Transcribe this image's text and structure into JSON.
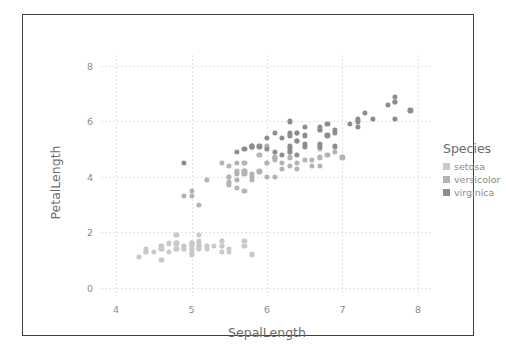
{
  "chart_data": {
    "type": "scatter",
    "title": "",
    "xlabel": "SepalLength",
    "ylabel": "PetalLength",
    "xlim": [
      3.8,
      8.2
    ],
    "ylim": [
      -0.3,
      8.4
    ],
    "xticks": [
      "4",
      "5",
      "6",
      "7",
      "8"
    ],
    "xtick_values": [
      4,
      5,
      6,
      7,
      8
    ],
    "yticks": [
      "0",
      "2",
      "4",
      "6",
      "8"
    ],
    "ytick_values": [
      0,
      2,
      4,
      6,
      8
    ],
    "grid": true,
    "legend": {
      "title": "Species",
      "position": "right",
      "entries": [
        {
          "label": "setosa",
          "color": "#c9c9c9"
        },
        {
          "label": "versicolor",
          "color": "#b3b3b3"
        },
        {
          "label": "virginica",
          "color": "#8d8d8d"
        }
      ]
    },
    "colors": {
      "setosa": "#c9c9c9",
      "versicolor": "#b3b3b3",
      "virginica": "#8d8d8d",
      "grid": "#e2e2e4",
      "frame": "#3f3f3f",
      "tick_text": "#8a8a8a",
      "axis_title": "#6b6b6b",
      "background": "#ffffff"
    },
    "series": [
      {
        "name": "setosa",
        "color": "#c9c9c9",
        "x": [
          5.1,
          4.9,
          4.7,
          4.6,
          5.0,
          5.4,
          4.6,
          5.0,
          4.4,
          4.9,
          5.4,
          4.8,
          4.8,
          4.3,
          5.8,
          5.7,
          5.4,
          5.1,
          5.7,
          5.1,
          5.4,
          5.1,
          4.6,
          5.1,
          4.8,
          5.0,
          5.0,
          5.2,
          5.2,
          4.7,
          4.8,
          5.4,
          5.2,
          5.5,
          4.9,
          5.0,
          5.5,
          4.9,
          4.4,
          5.1,
          5.0,
          4.5,
          4.4,
          5.0,
          5.1,
          4.8,
          5.1,
          4.6,
          5.3,
          5.0
        ],
        "y": [
          1.4,
          1.4,
          1.3,
          1.5,
          1.4,
          1.7,
          1.4,
          1.5,
          1.4,
          1.5,
          1.5,
          1.6,
          1.4,
          1.1,
          1.2,
          1.5,
          1.3,
          1.4,
          1.7,
          1.5,
          1.7,
          1.5,
          1.0,
          1.7,
          1.9,
          1.6,
          1.6,
          1.5,
          1.4,
          1.6,
          1.6,
          1.5,
          1.5,
          1.4,
          1.5,
          1.2,
          1.3,
          1.4,
          1.3,
          1.5,
          1.3,
          1.3,
          1.3,
          1.6,
          1.9,
          1.4,
          1.6,
          1.4,
          1.5,
          1.4
        ]
      },
      {
        "name": "versicolor",
        "color": "#b3b3b3",
        "x": [
          7.0,
          6.4,
          6.9,
          5.5,
          6.5,
          5.7,
          6.3,
          4.9,
          6.6,
          5.2,
          5.0,
          5.9,
          6.0,
          6.1,
          5.6,
          6.7,
          5.6,
          5.8,
          6.2,
          5.6,
          5.9,
          6.1,
          6.3,
          6.1,
          6.4,
          6.6,
          6.8,
          6.7,
          6.0,
          5.7,
          5.5,
          5.5,
          5.8,
          6.0,
          5.4,
          6.0,
          6.7,
          6.3,
          5.6,
          5.5,
          5.5,
          6.1,
          5.8,
          5.0,
          5.6,
          5.7,
          5.7,
          6.2,
          5.1,
          5.7
        ],
        "y": [
          4.7,
          4.5,
          4.9,
          4.0,
          4.6,
          4.5,
          4.7,
          3.3,
          4.6,
          3.9,
          3.5,
          4.2,
          4.0,
          4.7,
          3.6,
          4.4,
          4.5,
          4.1,
          4.5,
          3.9,
          4.8,
          4.0,
          4.9,
          4.7,
          4.3,
          4.4,
          4.8,
          5.0,
          4.5,
          3.5,
          3.8,
          3.7,
          3.9,
          5.1,
          4.5,
          4.5,
          4.7,
          4.4,
          4.1,
          4.0,
          4.4,
          4.6,
          4.0,
          3.3,
          4.2,
          4.2,
          4.2,
          4.3,
          3.0,
          4.1
        ]
      },
      {
        "name": "virginica",
        "color": "#8d8d8d",
        "x": [
          6.3,
          5.8,
          7.1,
          6.3,
          6.5,
          7.6,
          4.9,
          7.3,
          6.7,
          7.2,
          6.5,
          6.4,
          6.8,
          5.7,
          5.8,
          6.4,
          6.5,
          7.7,
          7.7,
          6.0,
          6.9,
          5.6,
          7.7,
          6.3,
          6.7,
          7.2,
          6.2,
          6.1,
          6.4,
          7.2,
          7.4,
          7.9,
          6.4,
          6.3,
          6.1,
          7.7,
          6.3,
          6.4,
          6.0,
          6.9,
          6.7,
          6.9,
          5.8,
          6.8,
          6.7,
          6.7,
          6.3,
          6.5,
          6.2,
          5.9
        ],
        "y": [
          6.0,
          5.1,
          5.9,
          5.6,
          5.8,
          6.6,
          4.5,
          6.3,
          5.8,
          6.1,
          5.1,
          5.3,
          5.5,
          5.0,
          5.1,
          5.3,
          5.5,
          6.7,
          6.9,
          5.0,
          5.7,
          4.9,
          6.7,
          4.9,
          5.7,
          6.0,
          4.8,
          4.9,
          5.6,
          5.8,
          6.1,
          6.4,
          5.6,
          5.1,
          5.6,
          6.1,
          5.5,
          4.8,
          5.4,
          5.6,
          5.1,
          5.1,
          5.1,
          5.9,
          5.7,
          5.2,
          5.0,
          5.2,
          5.4,
          5.1
        ]
      }
    ]
  }
}
